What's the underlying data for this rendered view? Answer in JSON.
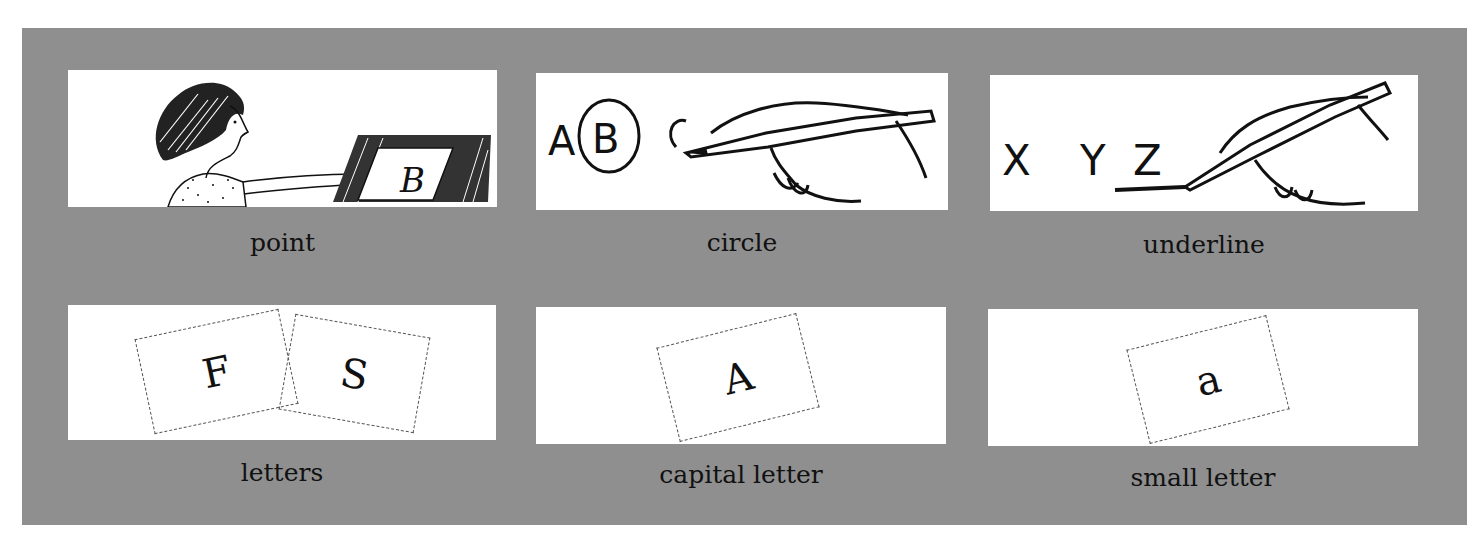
{
  "colors": {
    "panel": "#8f8f8f",
    "card": "#ffffff",
    "ink": "#111111"
  },
  "items": [
    {
      "label": "point",
      "illustration": "woman-pointing-at-letter",
      "letters": [
        "B"
      ]
    },
    {
      "label": "circle",
      "illustration": "hand-circling-letter",
      "letters": [
        "A",
        "B",
        "C"
      ]
    },
    {
      "label": "underline",
      "illustration": "hand-underlining-letter",
      "letters": [
        "X",
        "Y",
        "Z"
      ]
    },
    {
      "label": "letters",
      "illustration": "letter-cards",
      "letters": [
        "F",
        "S"
      ]
    },
    {
      "label": "capital letter",
      "illustration": "capital-letter-card",
      "letters": [
        "A"
      ]
    },
    {
      "label": "small letter",
      "illustration": "small-letter-card",
      "letters": [
        "a"
      ]
    }
  ]
}
